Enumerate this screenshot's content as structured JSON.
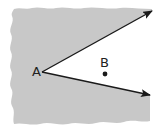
{
  "diagram": {
    "vertex": {
      "label": "A"
    },
    "point": {
      "label": "B",
      "location": "interior of angle"
    },
    "rays": [
      {
        "name": "upper-ray",
        "from": "A",
        "direction": "up-right",
        "arrowhead": true
      },
      {
        "name": "lower-ray",
        "from": "A",
        "direction": "down-right",
        "arrowhead": true
      }
    ],
    "shaded_region": "exterior of the angle",
    "colors": {
      "shade": "#c8c8c8",
      "ray": "#1a1a1a",
      "background": "#ffffff",
      "label": "#222222"
    }
  }
}
